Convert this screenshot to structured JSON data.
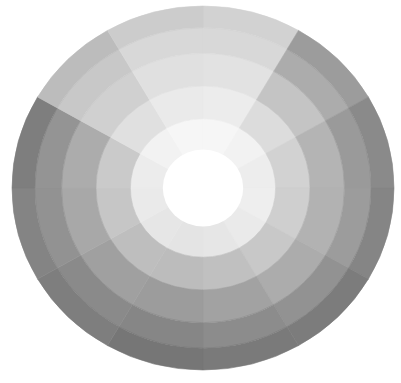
{
  "image": {
    "subject": "painted grayscale value wheel",
    "background": "#ffffff",
    "center": [
      203,
      188
    ],
    "radius_x": 191,
    "radius_y": 182,
    "center_color": "#ffffff",
    "ring_radii": [
      0.2,
      0.38,
      0.56,
      0.74,
      0.88,
      1.0
    ],
    "sector_count": 12,
    "start_angle_deg": -90,
    "sectors": [
      {
        "shades": [
          "#f6f6f6",
          "#ececec",
          "#e2e2e2",
          "#d8d8d8",
          "#d2d2d2"
        ]
      },
      {
        "shades": [
          "#f2f2f2",
          "#dcdcdc",
          "#c4c4c4",
          "#acacac",
          "#9c9c9c"
        ]
      },
      {
        "shades": [
          "#ededed",
          "#d2d2d2",
          "#b4b4b4",
          "#9a9a9a",
          "#8a8a8a"
        ]
      },
      {
        "shades": [
          "#eeeeee",
          "#cfcfcf",
          "#b2b2b2",
          "#9c9c9c",
          "#858585"
        ]
      },
      {
        "shades": [
          "#eaeaea",
          "#c8c8c8",
          "#acacac",
          "#929292",
          "#7c7c7c"
        ]
      },
      {
        "shades": [
          "#e6e6e6",
          "#c0c0c0",
          "#a2a2a2",
          "#8c8c8c",
          "#7a7a7a"
        ]
      },
      {
        "shades": [
          "#e4e4e4",
          "#bcbcbc",
          "#9c9c9c",
          "#868686",
          "#767676"
        ]
      },
      {
        "shades": [
          "#e6e6e6",
          "#bebebe",
          "#a0a0a0",
          "#8a8a8a",
          "#7e7e7e"
        ]
      },
      {
        "shades": [
          "#eaeaea",
          "#c6c6c6",
          "#a8a8a8",
          "#929292",
          "#848484"
        ]
      },
      {
        "shades": [
          "#ececec",
          "#cacaca",
          "#acacac",
          "#949494",
          "#7e7e7e"
        ]
      },
      {
        "shades": [
          "#f2f2f2",
          "#e0e0e0",
          "#d0d0d0",
          "#c8c8c8",
          "#bcbcbc"
        ]
      },
      {
        "shades": [
          "#f6f6f6",
          "#eaeaea",
          "#e0e0e0",
          "#d8d8d8",
          "#cccccc"
        ]
      }
    ]
  }
}
